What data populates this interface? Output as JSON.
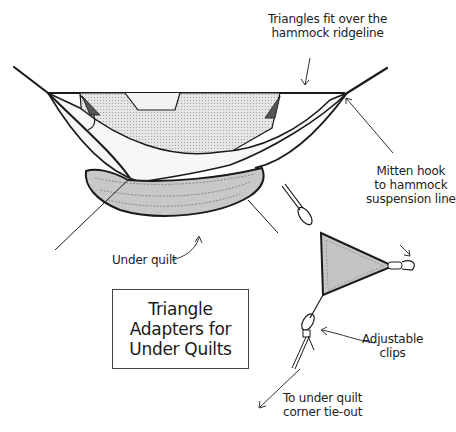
{
  "diagram": {
    "title_lines": [
      "Triangle",
      "Adapters for",
      "Under Quilts"
    ],
    "labels": {
      "ridgeline": [
        "Triangles fit over the",
        "hammock ridgeline"
      ],
      "mitten_hook": [
        "Mitten hook",
        "to hammock",
        "suspension line"
      ],
      "under_quilt": "Under quilt",
      "adjustable_clips": [
        "Adjustable",
        "clips"
      ],
      "tie_out": [
        "To under quilt",
        "corner tie-out"
      ]
    },
    "colors": {
      "ink": "#1a1a1a",
      "quilt_fill": "#c8c8c8",
      "netting_fill": "#dcdcdc",
      "triangle_fill": "#c4c4c4",
      "background": "#ffffff"
    }
  }
}
